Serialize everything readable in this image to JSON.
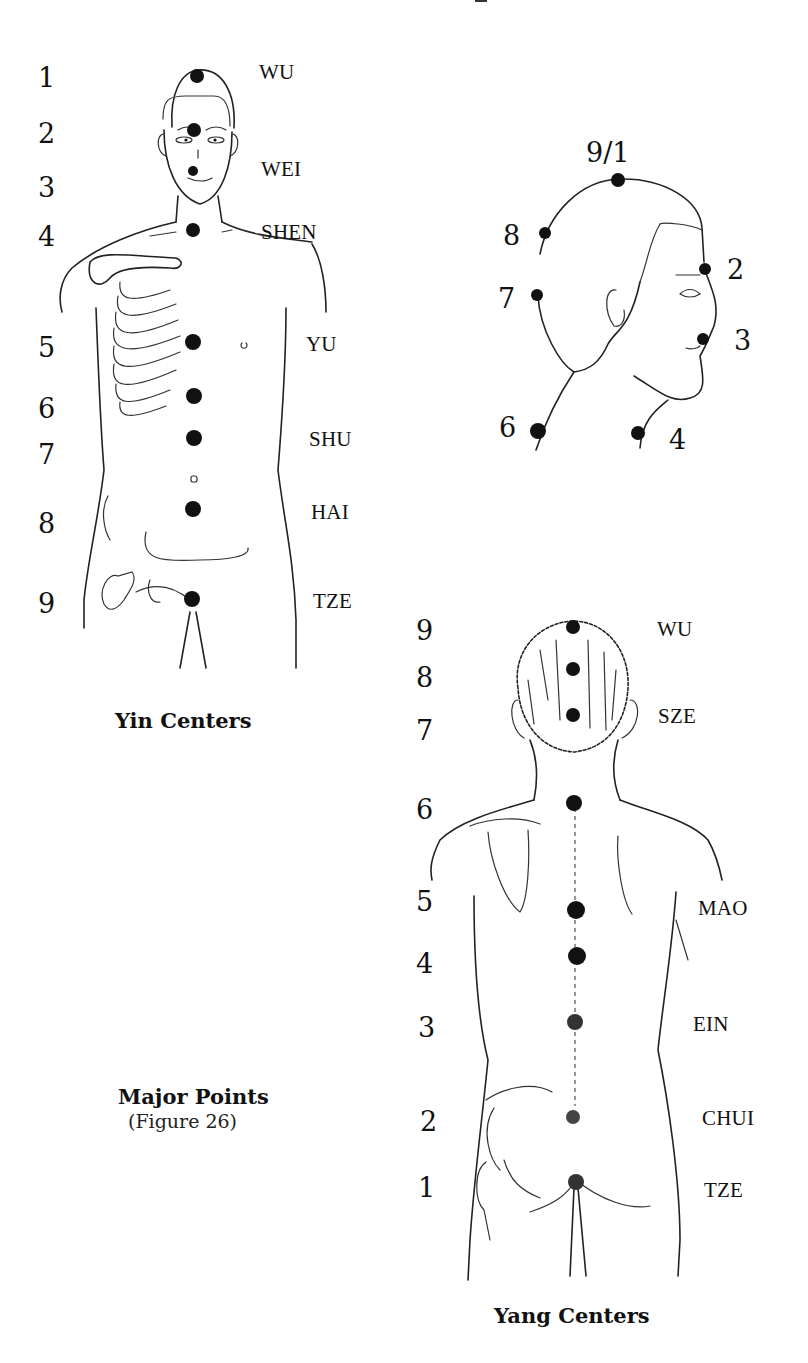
{
  "page": {
    "header_fragment": "— — — — — y — — — —"
  },
  "yin_figure": {
    "caption": "Yin Centers",
    "numbers": [
      "1",
      "2",
      "3",
      "4",
      "5",
      "6",
      "7",
      "8",
      "9"
    ],
    "labels": [
      "WU",
      "WEI",
      "SHEN",
      "YU",
      "SHU",
      "HAI",
      "TZE"
    ]
  },
  "head_profile_figure": {
    "numbers": [
      "9/1",
      "8",
      "2",
      "7",
      "3",
      "6",
      "4"
    ]
  },
  "yang_figure": {
    "caption": "Yang Centers",
    "numbers": [
      "9",
      "8",
      "7",
      "6",
      "5",
      "4",
      "3",
      "2",
      "1"
    ],
    "labels": [
      "WU",
      "SZE",
      "MAO",
      "EIN",
      "CHUI",
      "TZE"
    ]
  },
  "figure_caption": {
    "title": "Major Points",
    "subtitle": "(Figure 26)"
  }
}
